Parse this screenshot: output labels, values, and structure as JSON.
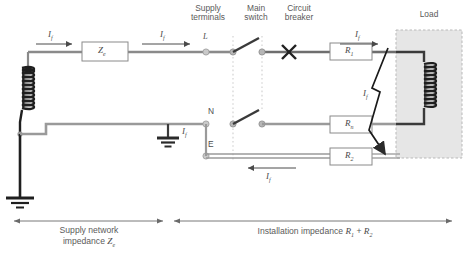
{
  "headers": {
    "supply_terminals": "Supply\nterminals",
    "supply_terminals_l1": "Supply",
    "supply_terminals_l2": "terminals",
    "main_switch_l1": "Main",
    "main_switch_l2": "switch",
    "circuit_breaker_l1": "Circuit",
    "circuit_breaker_l2": "breaker",
    "load": "Load"
  },
  "terminals": {
    "line": "L",
    "neutral": "N",
    "earth": "E"
  },
  "components": {
    "source_impedance": "Z",
    "source_impedance_sub": "e",
    "r1": "R",
    "r1_sub": "1",
    "rn": "R",
    "rn_sub": "n",
    "r2": "R",
    "r2_sub": "2"
  },
  "currents": {
    "i_top_left": "I",
    "i_top_left_sub": "f",
    "i_top_mid": "I",
    "i_top_mid_sub": "f",
    "i_top_right": "I",
    "i_top_right_sub": "f",
    "i_ground": "I",
    "i_ground_sub": "f",
    "i_fault": "I",
    "i_fault_sub": "f",
    "i_bottom": "I",
    "i_bottom_sub": "f"
  },
  "captions": {
    "left_l1": "Supply network",
    "left_l2_prefix": "impedance ",
    "left_l2_sym": "Z",
    "left_l2_sub": "e",
    "right_prefix": "Installation impedance ",
    "right_sym1": "R",
    "right_sub1": "1",
    "right_plus": " + ",
    "right_sym2": "R",
    "right_sub2": "2"
  },
  "colors": {
    "wire": "#808080",
    "dark_wire": "#3a3a3a",
    "text": "#555555",
    "load_fill": "#e4e4e4",
    "load_border": "#b4b4b4",
    "box_border": "#8a8a8a",
    "dotted_guide": "#cfcfcf"
  }
}
